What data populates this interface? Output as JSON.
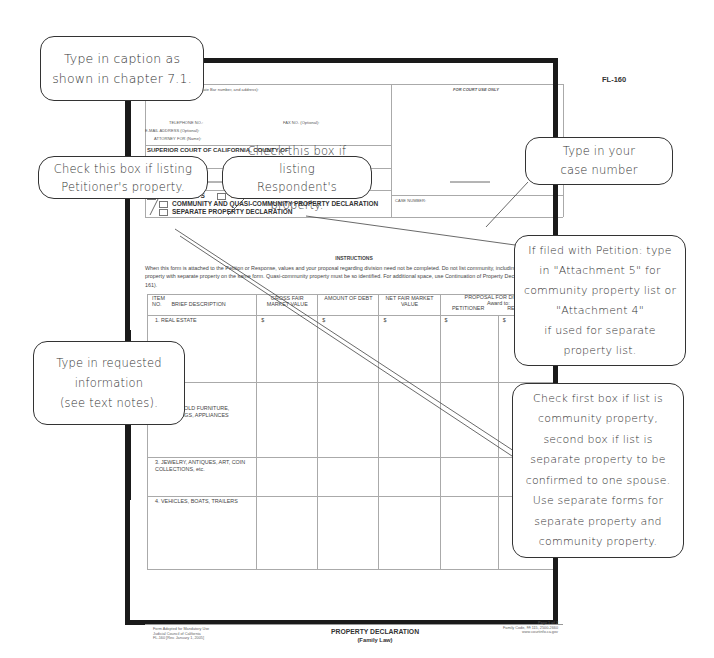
{
  "form": {
    "form_number": "FL-160",
    "attorney_label": "ATTORNEY OR PARTY WITHOUT ATTORNEY (Name, State Bar number, and address):",
    "attorney_label_visible": "THOUT ATTORNEY (Name, State Bar number, and address):",
    "court_use": "FOR COURT USE ONLY",
    "telephone_label": "TELEPHONE NO.:",
    "fax_label": "FAX NO. (Optional):",
    "email_label": "E-MAIL ADDRESS (Optional):",
    "attorney_for_label": "ATTORNEY FOR (Name):",
    "court_title": "SUPERIOR COURT OF CALIFORNIA, COUNTY OF",
    "street_label": "STREET ADDRESS:",
    "respondent_label": "RESPONDENT:",
    "checkbox_petitioner": "PETITIONER'S",
    "checkbox_respondent": "RESPONDENT'S",
    "checkbox_community": "COMMUNITY AND QUASI-COMMUNITY PROPERTY DECLARATION",
    "checkbox_separate": "SEPARATE PROPERTY DECLARATION",
    "case_number_label": "CASE NUMBER:",
    "instructions_title": "INSTRUCTIONS",
    "instructions_text": "When this form is attached to the Petition or Response, values and your proposal regarding division need not be completed. Do not list community, including quasi-community, property with separate property on the same form. Quasi-community property must be so identified. For additional space, use Continuation of Property Declaration (form FL-161).",
    "table": {
      "headers": {
        "item_no": "ITEM NO.",
        "description": "BRIEF DESCRIPTION",
        "gross": "GROSS FAIR MARKET VALUE",
        "debt": "AMOUNT OF DEBT",
        "net": "NET FAIR MARKET VALUE",
        "proposal": "PROPOSAL FOR DIVISION",
        "award_to": "Award to:",
        "petitioner": "PETITIONER",
        "respondent": "RESPONDENT"
      },
      "currency_symbol": "$",
      "rows": [
        {
          "label": "1.  REAL ESTATE"
        },
        {
          "label": "2.  HOUSEHOLD FURNITURE, FURNISHINGS, APPLIANCES",
          "visible": "D FURNITURE, GS, APPLIANCES"
        },
        {
          "label": "3.  JEWELRY, ANTIQUES, ART, COIN COLLECTIONS, etc."
        },
        {
          "label": "4.  VEHICLES, BOATS, TRAILERS"
        }
      ]
    },
    "footer": {
      "left": [
        "Form Adopted for Mandatory Use",
        "Judicial Council of California",
        "FL-160 [Rev. January 1, 2005]"
      ],
      "title": "PROPERTY DECLARATION",
      "subtitle": "(Family Law)",
      "page": "Page 1 of 2",
      "right": [
        "Family Code, §§ 115, 2500-2660",
        "www.courtinfo.ca.gov"
      ]
    }
  },
  "callouts": {
    "caption": [
      "Type in caption as",
      "shown in chapter 7.1."
    ],
    "petitioner": [
      "Check this box if listing",
      "Petitioner's property."
    ],
    "respondent": [
      "Check this box if listing",
      "Respondent's property."
    ],
    "case_number": [
      "Type in your",
      "case number"
    ],
    "attachment": [
      "If filed with Petition: type",
      "in \"Attachment 5\" for",
      "community property list or",
      "\"Attachment 4\"",
      "if used for separate",
      "property list."
    ],
    "requested_info": [
      "Type in requested",
      "information",
      "(see text notes)."
    ],
    "first_box": [
      "Check first box if list is",
      "community property,",
      "second box if list is",
      "separate property to be",
      "confirmed to one spouse.",
      "Use separate forms for",
      "separate property and",
      "community property."
    ]
  }
}
